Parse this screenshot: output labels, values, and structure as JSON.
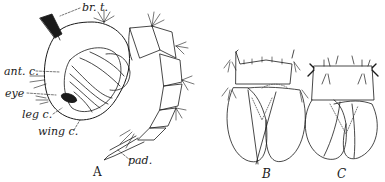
{
  "figure": {
    "panels": [
      {
        "id": "A",
        "label": "A"
      },
      {
        "id": "B",
        "label": "B"
      },
      {
        "id": "C",
        "label": "C"
      }
    ],
    "annotations": [
      {
        "id": "br-t",
        "text": "br. t."
      },
      {
        "id": "ant-c",
        "text": "ant. c."
      },
      {
        "id": "eye",
        "text": "eye"
      },
      {
        "id": "leg-c",
        "text": "leg c."
      },
      {
        "id": "wing-c",
        "text": "wing c."
      },
      {
        "id": "pad",
        "text": "pad."
      }
    ],
    "colors": {
      "ink": "#1a1a1a",
      "stipple": "#555555",
      "background": "#ffffff"
    }
  }
}
